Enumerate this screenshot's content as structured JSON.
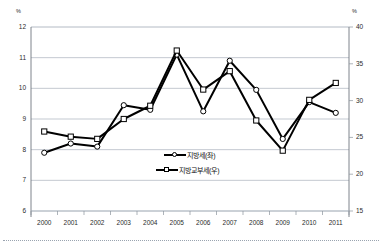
{
  "chart_data": {
    "type": "line",
    "title": "",
    "subtitle": "",
    "xlabel": "",
    "ylabel": "%",
    "y2label": "%",
    "grid": true,
    "legend_position": "inside-center-bottom",
    "categories": [
      "2000",
      "2001",
      "2002",
      "2003",
      "2004",
      "2005",
      "2006",
      "2007",
      "2008",
      "2009",
      "2010",
      "2011"
    ],
    "xtick_labels": [
      "2000",
      "2001",
      "2002",
      "2003",
      "2004",
      "2005",
      "2006",
      "2007",
      "2008",
      "2009",
      "2010",
      "2011"
    ],
    "ylim": [
      6,
      12
    ],
    "ytick_labels": [
      "12",
      "11",
      "10",
      "9",
      "8",
      "7",
      "6"
    ],
    "ytick_values": [
      12,
      11,
      10,
      9,
      8,
      7,
      6
    ],
    "y2lim": [
      15,
      40
    ],
    "y2tick_labels": [
      "40",
      "35",
      "30",
      "25",
      "20",
      "15"
    ],
    "y2tick_values": [
      40,
      35,
      30,
      25,
      20,
      15
    ],
    "series": [
      {
        "name": "지방세(좌)",
        "axis": "left",
        "marker": "circle",
        "color": "#000000",
        "values": [
          7.9,
          8.2,
          8.1,
          9.45,
          9.3,
          11.1,
          9.25,
          10.9,
          9.95,
          8.35,
          9.55,
          9.2
        ]
      },
      {
        "name": "지방교부세(우)",
        "axis": "right",
        "marker": "square",
        "color": "#000000",
        "values": [
          25.8,
          25.1,
          24.8,
          27.5,
          29.3,
          36.8,
          31.5,
          34.0,
          27.3,
          23.2,
          30.1,
          32.4
        ]
      }
    ],
    "legend": [
      {
        "label": "지방세(좌)",
        "marker": "circle"
      },
      {
        "label": "지방교부세(우)",
        "marker": "square"
      }
    ]
  }
}
